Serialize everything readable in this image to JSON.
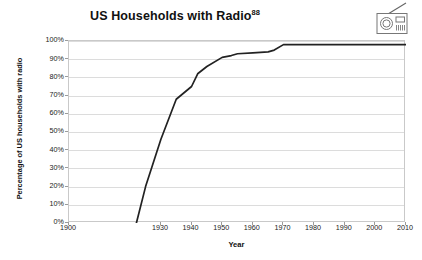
{
  "chart_data": {
    "type": "line",
    "title": "US Households with Radio",
    "title_superscript": "88",
    "xlabel": "Year",
    "ylabel": "Percentage of US households with radio",
    "xlim": [
      1900,
      2010
    ],
    "ylim": [
      0,
      100
    ],
    "grid": true,
    "legend": false,
    "line_color": "#222222",
    "x_tick_labels": [
      "1900",
      "1930",
      "1940",
      "1950",
      "1960",
      "1970",
      "1980",
      "1990",
      "2000",
      "2010"
    ],
    "x_tick_values": [
      1900,
      1930,
      1940,
      1950,
      1960,
      1970,
      1980,
      1990,
      2000,
      2010
    ],
    "y_tick_labels": [
      "0%",
      "10%",
      "20%",
      "30%",
      "40%",
      "50%",
      "60%",
      "70%",
      "80%",
      "90%",
      "100%"
    ],
    "y_tick_values": [
      0,
      10,
      20,
      30,
      40,
      50,
      60,
      70,
      80,
      90,
      100
    ],
    "series": [
      {
        "name": "US households with radio",
        "x": [
          1922,
          1925,
          1930,
          1935,
          1940,
          1942,
          1945,
          1950,
          1953,
          1955,
          1960,
          1965,
          1967,
          1970,
          1975,
          1980,
          1990,
          2000,
          2010
        ],
        "values": [
          0,
          20,
          46,
          68,
          75,
          82,
          86,
          91,
          92,
          93,
          93.5,
          94,
          95,
          98,
          98,
          98,
          98,
          98,
          98
        ]
      }
    ]
  },
  "icons": {
    "radio": "radio-icon"
  }
}
